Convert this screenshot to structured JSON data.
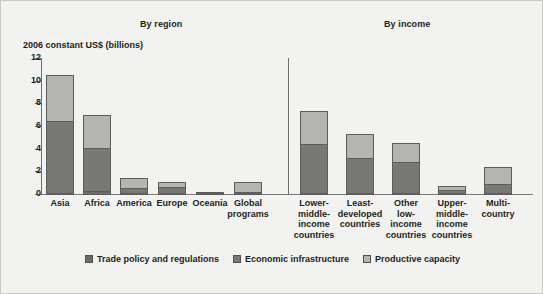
{
  "figure": {
    "background_color": "#f2f2f0",
    "group_headers": [
      {
        "id": "region",
        "label": "By region"
      },
      {
        "id": "income",
        "label": "By income"
      }
    ]
  },
  "chart_data": {
    "type": "bar",
    "subtype": "stacked",
    "title": "",
    "ylabel": "2006 constant US$ (billions)",
    "xlabel": "",
    "ylim": [
      0,
      12
    ],
    "yticks": [
      0,
      2,
      4,
      6,
      8,
      10,
      12
    ],
    "ytick_labels": [
      "0",
      "2",
      "4",
      "6",
      "8",
      "10",
      "12"
    ],
    "grid": false,
    "legend_position": "bottom-center",
    "groups": [
      "By region",
      "By income"
    ],
    "categories": [
      "Asia",
      "Africa",
      "America",
      "Europe",
      "Oceania",
      "Global programs",
      "Lower-middle-income countries",
      "Least-developed countries",
      "Other low-income countries",
      "Upper-middle-income countries",
      "Multi-country"
    ],
    "category_group": [
      "By region",
      "By region",
      "By region",
      "By region",
      "By region",
      "By region",
      "By income",
      "By income",
      "By income",
      "By income",
      "By income"
    ],
    "series": [
      {
        "name": "Trade policy and regulations",
        "color": "#6b6b69",
        "values": [
          0.2,
          0.35,
          0.12,
          0.1,
          0.03,
          0.12,
          0.15,
          0.12,
          0.1,
          0.05,
          0.08
        ]
      },
      {
        "name": "Economic infrastructure",
        "color": "#787876",
        "values": [
          6.4,
          3.85,
          0.5,
          0.65,
          0.1,
          0.15,
          4.45,
          3.2,
          2.8,
          0.35,
          0.9
        ]
      },
      {
        "name": "Productive capacity",
        "color": "#b4b4b2",
        "values": [
          4.2,
          3.0,
          1.03,
          0.5,
          0.07,
          1.03,
          3.0,
          2.2,
          1.8,
          0.45,
          1.6
        ]
      }
    ],
    "totals": [
      10.8,
      7.2,
      1.65,
      1.25,
      0.2,
      1.3,
      7.6,
      5.52,
      4.7,
      0.85,
      2.58
    ]
  },
  "x_labels": [
    {
      "lines": [
        "Asia"
      ]
    },
    {
      "lines": [
        "Africa"
      ]
    },
    {
      "lines": [
        "America"
      ]
    },
    {
      "lines": [
        "Europe"
      ]
    },
    {
      "lines": [
        "Oceania"
      ]
    },
    {
      "lines": [
        "Global",
        "programs"
      ]
    },
    {
      "lines": [
        "Lower-",
        "middle-",
        "income",
        "countries"
      ]
    },
    {
      "lines": [
        "Least-",
        "developed",
        "countries"
      ]
    },
    {
      "lines": [
        "Other",
        "low-",
        "income",
        "countries"
      ]
    },
    {
      "lines": [
        "Upper-",
        "middle-",
        "income",
        "countries"
      ]
    },
    {
      "lines": [
        "Multi-",
        "country"
      ]
    }
  ],
  "legend": [
    {
      "label": "Trade policy and regulations",
      "swatch": "trade",
      "color": "#6b6b69"
    },
    {
      "label": "Economic infrastructure",
      "swatch": "econ",
      "color": "#787876"
    },
    {
      "label": "Productive capacity",
      "swatch": "prod",
      "color": "#b4b4b2"
    }
  ]
}
